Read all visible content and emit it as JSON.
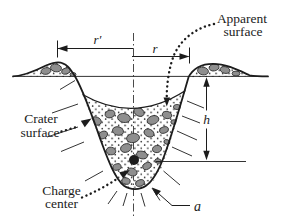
{
  "labels": {
    "apparent_surface": {
      "line1": "Apparent",
      "line2": "surface"
    },
    "crater_surface": {
      "line1": "Crater",
      "line2": "surface"
    },
    "charge_center": {
      "line1": "Charge",
      "line2": "center"
    }
  },
  "dimensions": {
    "radius_left": "r′",
    "radius_right": "r",
    "depth": "h",
    "bottom_zone": "a"
  },
  "colors": {
    "ink": "#1c1c1c",
    "stone_fill": "#8e8e8e",
    "stone_stroke": "#2b2b2b",
    "background": "#ffffff"
  }
}
